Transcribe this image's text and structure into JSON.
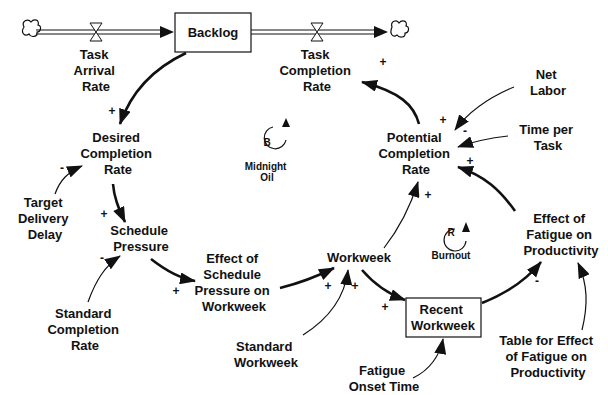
{
  "diagram": {
    "type": "stock-and-flow / causal loop diagram",
    "stocks": [
      {
        "id": "backlog",
        "label": "Backlog"
      },
      {
        "id": "recent_workweek",
        "label_lines": [
          "Recent",
          "Workweek"
        ]
      }
    ],
    "flows": [
      {
        "id": "task_arrival_rate",
        "label_lines": [
          "Task",
          "Arrival",
          "Rate"
        ]
      },
      {
        "id": "task_completion_rate",
        "label_lines": [
          "Task",
          "Completion",
          "Rate"
        ]
      }
    ],
    "variables": [
      {
        "id": "desired_completion_rate",
        "label_lines": [
          "Desired",
          "Completion",
          "Rate"
        ]
      },
      {
        "id": "target_delivery_delay",
        "label_lines": [
          "Target",
          "Delivery",
          "Delay"
        ]
      },
      {
        "id": "schedule_pressure",
        "label_lines": [
          "Schedule",
          "Pressure"
        ]
      },
      {
        "id": "standard_completion_rate",
        "label_lines": [
          "Standard",
          "Completion",
          "Rate"
        ]
      },
      {
        "id": "effect_schedule_pressure",
        "label_lines": [
          "Effect of",
          "Schedule",
          "Pressure on",
          "Workweek"
        ]
      },
      {
        "id": "workweek",
        "label_lines": [
          "Workweek"
        ]
      },
      {
        "id": "standard_workweek",
        "label_lines": [
          "Standard",
          "Workweek"
        ]
      },
      {
        "id": "fatigue_onset_time",
        "label_lines": [
          "Fatigue",
          "Onset Time"
        ]
      },
      {
        "id": "potential_completion_rate",
        "label_lines": [
          "Potential",
          "Completion",
          "Rate"
        ]
      },
      {
        "id": "net_labor",
        "label_lines": [
          "Net",
          "Labor"
        ]
      },
      {
        "id": "time_per_task",
        "label_lines": [
          "Time per",
          "Task"
        ]
      },
      {
        "id": "effect_fatigue_productivity",
        "label_lines": [
          "Effect of",
          "Fatigue on",
          "Productivity"
        ]
      },
      {
        "id": "table_effect_fatigue",
        "label_lines": [
          "Table for Effect",
          "of Fatigue on",
          "Productivity"
        ]
      }
    ],
    "loops": [
      {
        "id": "B",
        "letter": "B",
        "name_lines": [
          "Midnight",
          "Oil"
        ]
      },
      {
        "id": "R",
        "letter": "R",
        "name_lines": [
          "Burnout"
        ]
      }
    ],
    "links": [
      {
        "from": "backlog",
        "to": "desired_completion_rate",
        "polarity": "+"
      },
      {
        "from": "target_delivery_delay",
        "to": "desired_completion_rate",
        "polarity": "-"
      },
      {
        "from": "desired_completion_rate",
        "to": "schedule_pressure",
        "polarity": "+"
      },
      {
        "from": "standard_completion_rate",
        "to": "schedule_pressure",
        "polarity": "-"
      },
      {
        "from": "schedule_pressure",
        "to": "effect_schedule_pressure",
        "polarity": "+"
      },
      {
        "from": "effect_schedule_pressure",
        "to": "workweek",
        "polarity": "+"
      },
      {
        "from": "standard_workweek",
        "to": "workweek",
        "polarity": "+"
      },
      {
        "from": "workweek",
        "to": "recent_workweek",
        "polarity": "+"
      },
      {
        "from": "fatigue_onset_time",
        "to": "recent_workweek",
        "polarity": ""
      },
      {
        "from": "recent_workweek",
        "to": "effect_fatigue_productivity",
        "polarity": "-"
      },
      {
        "from": "table_effect_fatigue",
        "to": "effect_fatigue_productivity",
        "polarity": ""
      },
      {
        "from": "effect_fatigue_productivity",
        "to": "potential_completion_rate",
        "polarity": "+"
      },
      {
        "from": "workweek",
        "to": "potential_completion_rate",
        "polarity": "+"
      },
      {
        "from": "net_labor",
        "to": "potential_completion_rate",
        "polarity": "+"
      },
      {
        "from": "time_per_task",
        "to": "potential_completion_rate",
        "polarity": "-"
      },
      {
        "from": "potential_completion_rate",
        "to": "task_completion_rate",
        "polarity": "+"
      }
    ],
    "colors": {
      "ink": "#111111",
      "background": "#ffffff"
    }
  }
}
